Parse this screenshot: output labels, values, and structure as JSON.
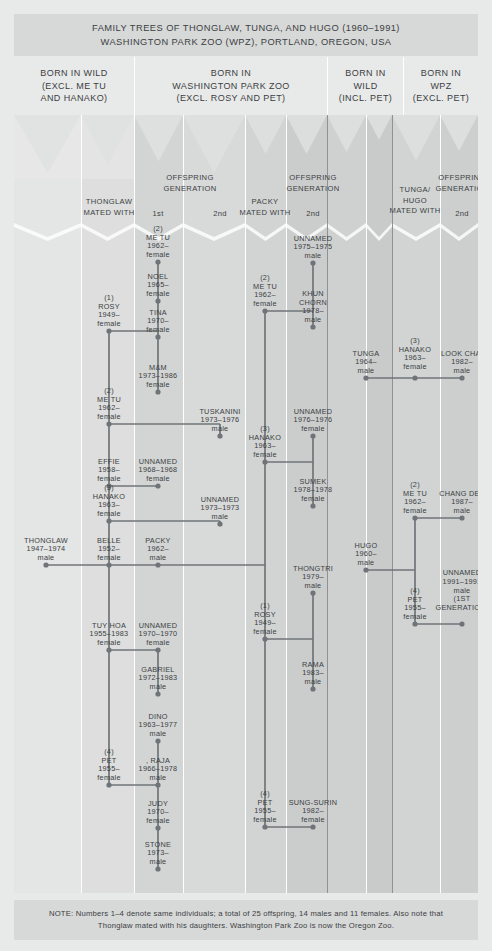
{
  "title": {
    "line1": "FAMILY TREES OF THONGLAW, TUNGA, AND HUGO (1960–1991)",
    "line2": "WASHINGTON PARK ZOO (WPZ), PORTLAND, OREGON, USA"
  },
  "categories": [
    {
      "id": "born-in-wild-excl",
      "lines": [
        "BORN IN WILD",
        "(EXCL. ME TU",
        "AND HANAKO)"
      ],
      "left": 0,
      "width": 120
    },
    {
      "id": "born-in-wpz-excl",
      "lines": [
        "BORN IN",
        "WASHINGTON PARK ZOO",
        "(EXCL. ROSY AND PET)"
      ],
      "left": 120,
      "width": 193
    },
    {
      "id": "born-in-wild-incl-pet",
      "lines": [
        "BORN IN",
        "WILD",
        "(INCL. PET)"
      ],
      "left": 313,
      "width": 76
    },
    {
      "id": "born-in-wpz-excl-pet",
      "lines": [
        "BORN IN",
        "WPZ",
        "(EXCL. PET)"
      ],
      "left": 389,
      "width": 75
    }
  ],
  "subheads": [
    {
      "id": "thonglaw-mated-with",
      "lines": [
        "THONGLAW",
        "MATED WITH"
      ],
      "cx": 95
    },
    {
      "id": "offspring-generation-1",
      "lines": [
        "OFFSPRING",
        "GENERATION"
      ],
      "cx": 176
    },
    {
      "id": "gen-1st",
      "lines": [
        "1st"
      ],
      "cx": 144
    },
    {
      "id": "gen-2nd-a",
      "lines": [
        "2nd"
      ],
      "cx": 206
    },
    {
      "id": "packy-mated-with",
      "lines": [
        "PACKY",
        "MATED WITH"
      ],
      "cx": 251
    },
    {
      "id": "offspring-generation-2",
      "lines": [
        "OFFSPRING",
        "GENERATION"
      ],
      "cx": 299
    },
    {
      "id": "gen-2nd-b",
      "lines": [
        "2nd"
      ],
      "cx": 299
    },
    {
      "id": "tunga-hugo-mated-with",
      "lines": [
        "TUNGA/",
        "HUGO",
        "MATED WITH"
      ],
      "cx": 401
    },
    {
      "id": "offspring-generation-3",
      "lines": [
        "OFFSPRING",
        "GENERATION"
      ],
      "cx": 448
    },
    {
      "id": "gen-2nd-c",
      "lines": [
        "2nd"
      ],
      "cx": 448
    }
  ],
  "nodes": [
    {
      "id": "thonglaw",
      "lines": [
        "THONGLAW",
        "1947–1974",
        "male"
      ],
      "cx": 32,
      "cy": 565
    },
    {
      "id": "rosy-1-thonglaw",
      "lines": [
        "(1)",
        "ROSY",
        "1949–",
        "female"
      ],
      "cx": 95,
      "cy": 331
    },
    {
      "id": "metu-2-thonglaw",
      "lines": [
        "(2)",
        "ME TU",
        "1962–",
        "female"
      ],
      "cx": 95,
      "cy": 424
    },
    {
      "id": "effie-thonglaw",
      "lines": [
        "EFFIE",
        "1958–",
        "female"
      ],
      "cx": 95,
      "cy": 486
    },
    {
      "id": "hanako-3-thonglaw",
      "lines": [
        "(3)",
        "HANAKO",
        "1963–",
        "female"
      ],
      "cx": 95,
      "cy": 521
    },
    {
      "id": "belle-thonglaw",
      "lines": [
        "BELLE",
        "1952–",
        "female"
      ],
      "cx": 95,
      "cy": 565
    },
    {
      "id": "tuyhoa-thonglaw",
      "lines": [
        "TUY HOA",
        "1955–1983",
        "female"
      ],
      "cx": 95,
      "cy": 650
    },
    {
      "id": "pet-4-thonglaw",
      "lines": [
        "(4)",
        "PET",
        "1955–",
        "female"
      ],
      "cx": 95,
      "cy": 785
    },
    {
      "id": "metu-offspring",
      "lines": [
        "(2)",
        "ME TU",
        "1962–",
        "female"
      ],
      "cx": 144,
      "cy": 262
    },
    {
      "id": "noel",
      "lines": [
        "NOEL",
        "1965–",
        "female"
      ],
      "cx": 144,
      "cy": 301
    },
    {
      "id": "tina",
      "lines": [
        "TINA",
        "1970–",
        "female"
      ],
      "cx": 144,
      "cy": 337
    },
    {
      "id": "mm",
      "lines": [
        "M&M",
        "1973–1986",
        "female"
      ],
      "cx": 144,
      "cy": 392
    },
    {
      "id": "unnamed-1968",
      "lines": [
        "UNNAMED",
        "1968–1968",
        "female"
      ],
      "cx": 144,
      "cy": 486
    },
    {
      "id": "packy",
      "lines": [
        "PACKY",
        "1962–",
        "male"
      ],
      "cx": 144,
      "cy": 565
    },
    {
      "id": "unnamed-1970",
      "lines": [
        "UNNAMED",
        "1970–1970",
        "female"
      ],
      "cx": 144,
      "cy": 650
    },
    {
      "id": "gabriel",
      "lines": [
        "GABRIEL",
        "1972–1983",
        "male"
      ],
      "cx": 144,
      "cy": 694
    },
    {
      "id": "dino",
      "lines": [
        "DINO",
        "1963–1977",
        "male"
      ],
      "cx": 144,
      "cy": 741
    },
    {
      "id": "raja",
      "lines": [
        ", RAJA",
        "1966–1978",
        "male"
      ],
      "cx": 144,
      "cy": 785
    },
    {
      "id": "judy",
      "lines": [
        "JUDY",
        "1970–",
        "female"
      ],
      "cx": 144,
      "cy": 828
    },
    {
      "id": "stone",
      "lines": [
        "STONE",
        "1973–",
        "male"
      ],
      "cx": 144,
      "cy": 869
    },
    {
      "id": "tuskanini",
      "lines": [
        "TUSKANINI",
        "1973–1976",
        "male"
      ],
      "cx": 206,
      "cy": 436
    },
    {
      "id": "unnamed-1973",
      "lines": [
        "UNNAMED",
        "1973–1973",
        "male"
      ],
      "cx": 206,
      "cy": 524
    },
    {
      "id": "metu-2-packy",
      "lines": [
        "(2)",
        "ME TU",
        "1962–",
        "female"
      ],
      "cx": 251,
      "cy": 311
    },
    {
      "id": "hanako-3-packy",
      "lines": [
        "(3)",
        "HANAKO",
        "1963–",
        "female"
      ],
      "cx": 251,
      "cy": 462
    },
    {
      "id": "rosy-1-packy",
      "lines": [
        "(1)",
        "ROSY",
        "1949–",
        "female"
      ],
      "cx": 251,
      "cy": 639
    },
    {
      "id": "pet-4-packy",
      "lines": [
        "(4)",
        "PET",
        "1955–",
        "female"
      ],
      "cx": 251,
      "cy": 827
    },
    {
      "id": "unnamed-1975",
      "lines": [
        "UNNAMED",
        "1975–1975",
        "male"
      ],
      "cx": 299,
      "cy": 263
    },
    {
      "id": "khun-chorn",
      "lines": [
        "KHUN",
        "CHORN",
        "1978–",
        "male"
      ],
      "cx": 299,
      "cy": 327
    },
    {
      "id": "unnamed-1976",
      "lines": [
        "UNNAMED",
        "1976–1976",
        "female"
      ],
      "cx": 299,
      "cy": 436
    },
    {
      "id": "sumek",
      "lines": [
        "SUMEK",
        "1978–1978",
        "female"
      ],
      "cx": 299,
      "cy": 506
    },
    {
      "id": "thongtri",
      "lines": [
        "THONGTRI",
        "1979–",
        "male"
      ],
      "cx": 299,
      "cy": 593
    },
    {
      "id": "rama",
      "lines": [
        "RAMA",
        "1983–",
        "male"
      ],
      "cx": 299,
      "cy": 689
    },
    {
      "id": "sung-surin",
      "lines": [
        "SUNG-SURIN",
        "1982–",
        "female"
      ],
      "cx": 299,
      "cy": 827
    },
    {
      "id": "tunga",
      "lines": [
        "TUNGA",
        "1964–",
        "male"
      ],
      "cx": 352,
      "cy": 378
    },
    {
      "id": "hugo",
      "lines": [
        "HUGO",
        "1960–",
        "male"
      ],
      "cx": 352,
      "cy": 570
    },
    {
      "id": "hanako-3-tunga",
      "lines": [
        "(3)",
        "HANAKO",
        "1963–",
        "female"
      ],
      "cx": 401,
      "cy": 374
    },
    {
      "id": "metu-2-hugo",
      "lines": [
        "(2)",
        "ME TU",
        "1962–",
        "female"
      ],
      "cx": 401,
      "cy": 518
    },
    {
      "id": "pet-4-hugo",
      "lines": [
        "(4)",
        "PET",
        "1955–",
        "female"
      ],
      "cx": 401,
      "cy": 624
    },
    {
      "id": "look-chai",
      "lines": [
        "LOOK CHAI",
        "1982–",
        "male"
      ],
      "cx": 448,
      "cy": 378
    },
    {
      "id": "chang-dee",
      "lines": [
        "CHANG DEE",
        "1987–",
        "male"
      ],
      "cx": 448,
      "cy": 518
    },
    {
      "id": "unnamed-1991",
      "lines": [
        "UNNAMED",
        "1991–1991",
        "male",
        "(1ST",
        "GENERATION)"
      ],
      "cx": 448,
      "cy": 615
    }
  ],
  "footer": {
    "line1": "NOTE: Numbers 1–4 denote same individuals; a total of 25 offspring, 14 males and 11 females. Also note that",
    "line2": "Thonglaw mated with his daughters. Washington Park Zoo is now the Oregon Zoo."
  },
  "colors": {
    "page_bg": "#e8e9e9",
    "band_bg": "#d7d8d8",
    "ink": "#3b3f42",
    "line": "#6f7478",
    "divider": "#ffffff"
  }
}
